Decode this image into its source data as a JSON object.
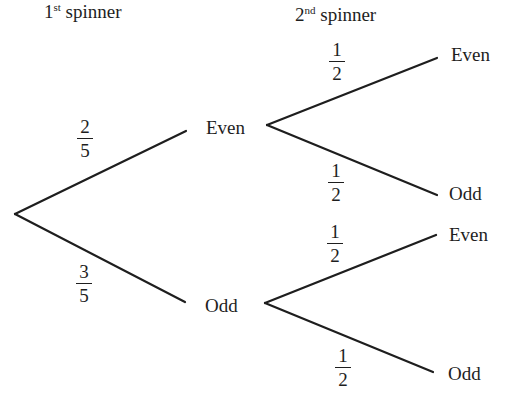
{
  "headers": {
    "first": {
      "num": "1",
      "suffix": "st",
      "text": " spinner"
    },
    "second": {
      "num": "2",
      "suffix": "nd",
      "text": " spinner"
    }
  },
  "first_spinner": {
    "even": {
      "label": "Even",
      "prob": {
        "num": "2",
        "den": "5"
      }
    },
    "odd": {
      "label": "Odd",
      "prob": {
        "num": "3",
        "den": "5"
      }
    }
  },
  "second_spinner": {
    "after_even": {
      "even": {
        "label": "Even",
        "prob": {
          "num": "1",
          "den": "2"
        }
      },
      "odd": {
        "label": "Odd",
        "prob": {
          "num": "1",
          "den": "2"
        }
      }
    },
    "after_odd": {
      "even": {
        "label": "Even",
        "prob": {
          "num": "1",
          "den": "2"
        }
      },
      "odd": {
        "label": "Odd",
        "prob": {
          "num": "1",
          "den": "2"
        }
      }
    }
  },
  "colors": {
    "line": "#1e1e1e",
    "text": "#1e1e1e",
    "background": "#ffffff"
  }
}
